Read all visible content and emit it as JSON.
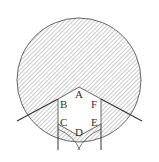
{
  "diagram": {
    "hatch_color": "#8a8a8a",
    "line_color": "#444444",
    "labels": {
      "A": "A",
      "B": "B",
      "C": "C",
      "D": "D",
      "E": "E",
      "F": "F"
    }
  }
}
